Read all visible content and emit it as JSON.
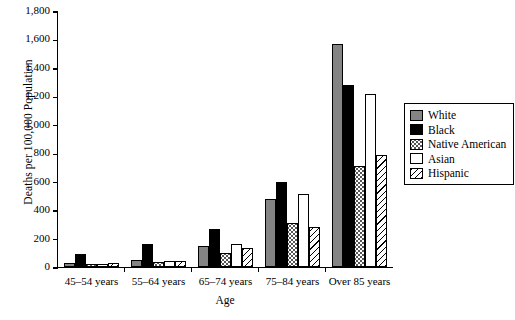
{
  "chart_data": {
    "type": "bar",
    "title": "",
    "xlabel": "Age",
    "ylabel": "Deaths per 100,000 Population",
    "ylim": [
      0,
      1800
    ],
    "yticks": [
      0,
      200,
      400,
      600,
      800,
      1000,
      1200,
      1400,
      1600,
      1800
    ],
    "ytick_labels": [
      "0",
      "200",
      "400",
      "600",
      "800",
      "1,000",
      "1,200",
      "1,400",
      "1,600",
      "1,800"
    ],
    "grid": false,
    "legend_position": "right",
    "categories": [
      "45–54 years",
      "55–64 years",
      "65–74 years",
      "75–84 years",
      "Over 85 years"
    ],
    "series": [
      {
        "name": "White",
        "fill": "f-white",
        "values": [
          25,
          50,
          145,
          480,
          1570
        ]
      },
      {
        "name": "Black",
        "fill": "f-black",
        "values": [
          90,
          160,
          265,
          600,
          1280
        ]
      },
      {
        "name": "Native American",
        "fill": "f-native",
        "values": [
          20,
          35,
          100,
          310,
          710
        ]
      },
      {
        "name": "Asian",
        "fill": "f-asian",
        "values": [
          20,
          45,
          165,
          515,
          1220
        ]
      },
      {
        "name": "Hispanic",
        "fill": "f-hispanic",
        "values": [
          25,
          45,
          135,
          280,
          790
        ]
      }
    ]
  }
}
